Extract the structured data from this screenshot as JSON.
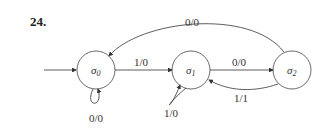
{
  "problem_number": "24.",
  "states": [
    {
      "id": "s0",
      "label": "σ",
      "sub": "0"
    },
    {
      "id": "s1",
      "label": "σ",
      "sub": "1"
    },
    {
      "id": "s2",
      "label": "σ",
      "sub": "2"
    }
  ],
  "transitions": [
    {
      "from": "s0",
      "to": "s0",
      "label": "0/0"
    },
    {
      "from": "s0",
      "to": "s1",
      "label": "1/0"
    },
    {
      "from": "s1",
      "to": "s1",
      "label": "1/0"
    },
    {
      "from": "s1",
      "to": "s2",
      "label": "0/0"
    },
    {
      "from": "s2",
      "to": "s1",
      "label": "1/1"
    },
    {
      "from": "s2",
      "to": "s0",
      "label": "0/0"
    }
  ],
  "start_state": "s0"
}
